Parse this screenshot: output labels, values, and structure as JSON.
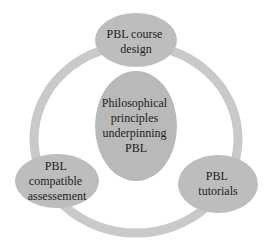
{
  "diagram": {
    "type": "cycle",
    "colors": {
      "ring": "#c9c9c9",
      "node_fill": "#bdbdbd",
      "center_fill": "#b9b9b9",
      "text": "#222222"
    },
    "center": {
      "lines": [
        "Philosophical",
        "principles",
        "underpinning",
        "PBL"
      ]
    },
    "nodes": [
      {
        "id": "course-design",
        "lines": [
          "PBL course",
          "design"
        ]
      },
      {
        "id": "tutorials",
        "lines": [
          "PBL",
          "tutorials"
        ]
      },
      {
        "id": "assessment",
        "lines": [
          "PBL",
          "compatible",
          "assessement"
        ]
      }
    ]
  }
}
